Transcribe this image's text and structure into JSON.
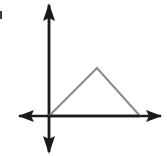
{
  "figure": {
    "title": "Triangle graphed on coordinate axes",
    "background_color": "#ffffff",
    "width": 167,
    "height": 156
  },
  "axes": {
    "color": "#1a1a1a",
    "line_width": 2.6,
    "origin": {
      "x": 49,
      "y": 116
    },
    "x_axis": {
      "name": "horizontal-axis",
      "start": {
        "x": 19,
        "y": 116
      },
      "end": {
        "x": 161,
        "y": 116
      },
      "arrow_left": true,
      "arrow_right": true
    },
    "y_axis": {
      "name": "vertical-axis",
      "start": {
        "x": 49,
        "y": 5
      },
      "end": {
        "x": 49,
        "y": 152
      },
      "arrow_up": true,
      "arrow_down": true
    },
    "arrow_head_length": 15,
    "arrow_head_width": 12
  },
  "shape": {
    "name": "triangle",
    "color": "#8c8c8c",
    "line_width": 2.1,
    "fill": "none",
    "vertices": [
      {
        "label": "left-vertex",
        "x": 49,
        "y": 116
      },
      {
        "label": "apex",
        "x": 97,
        "y": 68
      },
      {
        "label": "right-vertex",
        "x": 140,
        "y": 116
      }
    ],
    "closed_on_axis": true
  },
  "artifacts": [
    {
      "name": "edge-speck",
      "x": 0,
      "y": 11,
      "width": 2,
      "height": 8,
      "color": "#3a3a3a"
    }
  ],
  "chart_data": {
    "type": "line",
    "title": "",
    "xlabel": "",
    "ylabel": "",
    "grid": false,
    "legend": null,
    "series": [
      {
        "name": "triangle-outline",
        "points": [
          {
            "x": 0,
            "y": 0
          },
          {
            "x": 48,
            "y": 48
          },
          {
            "x": 91,
            "y": 0
          }
        ]
      }
    ],
    "note": "Points are in pixel offsets from the origin; apex is above the x-axis between the two base vertices."
  }
}
